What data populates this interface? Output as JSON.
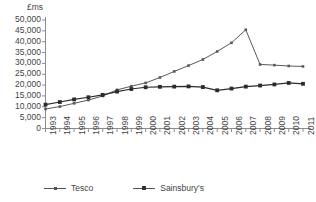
{
  "chart_data": {
    "type": "line",
    "title": "",
    "xlabel": "",
    "ylabel": "£ms",
    "ylim": [
      0,
      50000
    ],
    "ytick_values": [
      0,
      5000,
      10000,
      15000,
      20000,
      25000,
      30000,
      35000,
      40000,
      45000,
      50000
    ],
    "ytick_labels": [
      "0",
      "5,000",
      "10,000",
      "15,000",
      "20,000",
      "25,000",
      "30,000",
      "35,000",
      "40,000",
      "45,000",
      "50,000"
    ],
    "grid": false,
    "legend_position": "bottom-left",
    "x": [
      1993,
      1994,
      1995,
      1996,
      1997,
      1998,
      1999,
      2000,
      2001,
      2002,
      2003,
      2004,
      2005,
      2006,
      2007,
      2008,
      2009,
      2010,
      2011
    ],
    "xtick_labels": [
      "1993",
      "1994",
      "1995",
      "1996",
      "1997",
      "1998",
      "1999",
      "2000",
      "2001",
      "2002",
      "2003",
      "2004",
      "2005",
      "2006",
      "2007",
      "2008",
      "2009",
      "2010",
      "2011"
    ],
    "series": [
      {
        "name": "Tesco",
        "marker": "small-dot",
        "color": "#595959",
        "values": [
          9000,
          10100,
          11600,
          13100,
          15000,
          17800,
          19500,
          21000,
          23500,
          26300,
          29000,
          31800,
          35500,
          39500,
          45500,
          29500,
          29200,
          28800,
          28600
        ]
      },
      {
        "name": "Sainsbury's",
        "marker": "square",
        "color": "#2b2b2b",
        "values": [
          11000,
          12200,
          13400,
          14400,
          15500,
          17000,
          18200,
          19000,
          19200,
          19300,
          19400,
          19100,
          17600,
          18400,
          19300,
          19800,
          20300,
          21000,
          20600
        ]
      }
    ]
  },
  "legend": {
    "entries": [
      {
        "label": "Tesco"
      },
      {
        "label": "Sainsbury's"
      }
    ]
  }
}
